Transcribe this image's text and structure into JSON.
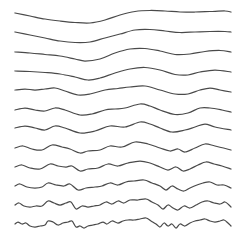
{
  "figure": {
    "width": 252,
    "height": 244,
    "background": "#ffffff",
    "stroke_color": "#4a4a4a",
    "stroke_width": 1.25,
    "lines": [
      {
        "id": 0,
        "baseline": 13,
        "points": [
          [
            15,
            13
          ],
          [
            30,
            16
          ],
          [
            45,
            19
          ],
          [
            60,
            21
          ],
          [
            75,
            22.5
          ],
          [
            90,
            23
          ],
          [
            105,
            20
          ],
          [
            120,
            15
          ],
          [
            135,
            11.5
          ],
          [
            150,
            10.5
          ],
          [
            165,
            11
          ],
          [
            180,
            12
          ],
          [
            195,
            12
          ],
          [
            210,
            11.5
          ],
          [
            225,
            11
          ],
          [
            231,
            12
          ]
        ]
      },
      {
        "id": 1,
        "baseline": 32,
        "points": [
          [
            15,
            32
          ],
          [
            30,
            35
          ],
          [
            45,
            38
          ],
          [
            60,
            41
          ],
          [
            75,
            42.5
          ],
          [
            90,
            42
          ],
          [
            105,
            38
          ],
          [
            120,
            34
          ],
          [
            135,
            30
          ],
          [
            150,
            29.5
          ],
          [
            165,
            31
          ],
          [
            180,
            32.5
          ],
          [
            195,
            32
          ],
          [
            210,
            31.5
          ],
          [
            225,
            31.5
          ],
          [
            231,
            32
          ]
        ]
      },
      {
        "id": 2,
        "baseline": 52,
        "points": [
          [
            15,
            52
          ],
          [
            30,
            53
          ],
          [
            45,
            54.5
          ],
          [
            60,
            56
          ],
          [
            75,
            59
          ],
          [
            85,
            61
          ],
          [
            100,
            59
          ],
          [
            115,
            53
          ],
          [
            130,
            49
          ],
          [
            145,
            48.5
          ],
          [
            160,
            51
          ],
          [
            175,
            54.5
          ],
          [
            190,
            54
          ],
          [
            205,
            51.5
          ],
          [
            220,
            50.5
          ],
          [
            231,
            52
          ]
        ]
      },
      {
        "id": 3,
        "baseline": 71,
        "points": [
          [
            15,
            71
          ],
          [
            30,
            71.5
          ],
          [
            45,
            72.5
          ],
          [
            60,
            74
          ],
          [
            75,
            77
          ],
          [
            88,
            80
          ],
          [
            100,
            78
          ],
          [
            115,
            73
          ],
          [
            130,
            69
          ],
          [
            145,
            67.5
          ],
          [
            160,
            70
          ],
          [
            175,
            74.5
          ],
          [
            188,
            75
          ],
          [
            200,
            72
          ],
          [
            215,
            70
          ],
          [
            231,
            72
          ]
        ]
      },
      {
        "id": 4,
        "baseline": 90,
        "points": [
          [
            15,
            90
          ],
          [
            25,
            89
          ],
          [
            35,
            90
          ],
          [
            45,
            89
          ],
          [
            55,
            88
          ],
          [
            65,
            91
          ],
          [
            78,
            95
          ],
          [
            90,
            94
          ],
          [
            105,
            90
          ],
          [
            118,
            88.5
          ],
          [
            130,
            87
          ],
          [
            145,
            86
          ],
          [
            160,
            90
          ],
          [
            175,
            94
          ],
          [
            188,
            94
          ],
          [
            200,
            90
          ],
          [
            210,
            88
          ],
          [
            220,
            90
          ],
          [
            231,
            92
          ]
        ]
      },
      {
        "id": 5,
        "baseline": 109,
        "points": [
          [
            15,
            110
          ],
          [
            25,
            108
          ],
          [
            35,
            110
          ],
          [
            45,
            111
          ],
          [
            55,
            108
          ],
          [
            65,
            110
          ],
          [
            80,
            115
          ],
          [
            92,
            114
          ],
          [
            105,
            110
          ],
          [
            115,
            109
          ],
          [
            125,
            108
          ],
          [
            140,
            104
          ],
          [
            150,
            106
          ],
          [
            160,
            110
          ],
          [
            175,
            114.5
          ],
          [
            188,
            113
          ],
          [
            200,
            108
          ],
          [
            210,
            108
          ],
          [
            222,
            110
          ],
          [
            231,
            112
          ]
        ]
      },
      {
        "id": 6,
        "baseline": 128,
        "points": [
          [
            15,
            128
          ],
          [
            25,
            126
          ],
          [
            35,
            128
          ],
          [
            45,
            130
          ],
          [
            55,
            126
          ],
          [
            65,
            128
          ],
          [
            80,
            133
          ],
          [
            95,
            131
          ],
          [
            110,
            126
          ],
          [
            125,
            127
          ],
          [
            140,
            122
          ],
          [
            150,
            124
          ],
          [
            160,
            128
          ],
          [
            172,
            132
          ],
          [
            185,
            130
          ],
          [
            195,
            127
          ],
          [
            205,
            124
          ],
          [
            215,
            127
          ],
          [
            231,
            130
          ]
        ]
      },
      {
        "id": 7,
        "baseline": 147,
        "points": [
          [
            15,
            148
          ],
          [
            23,
            146
          ],
          [
            32,
            149
          ],
          [
            42,
            150
          ],
          [
            52,
            145
          ],
          [
            62,
            147
          ],
          [
            70,
            149
          ],
          [
            80,
            153
          ],
          [
            88,
            151
          ],
          [
            100,
            150
          ],
          [
            110,
            146
          ],
          [
            122,
            147
          ],
          [
            135,
            142
          ],
          [
            148,
            144
          ],
          [
            160,
            148
          ],
          [
            170,
            151
          ],
          [
            178,
            149
          ],
          [
            185,
            152
          ],
          [
            195,
            148
          ],
          [
            205,
            144
          ],
          [
            215,
            146
          ],
          [
            231,
            150
          ]
        ]
      },
      {
        "id": 8,
        "baseline": 166,
        "points": [
          [
            15,
            167
          ],
          [
            22,
            165
          ],
          [
            30,
            168
          ],
          [
            40,
            169
          ],
          [
            50,
            164
          ],
          [
            58,
            166
          ],
          [
            66,
            167
          ],
          [
            72,
            166
          ],
          [
            80,
            171
          ],
          [
            88,
            169
          ],
          [
            98,
            168
          ],
          [
            108,
            164
          ],
          [
            118,
            166
          ],
          [
            128,
            163
          ],
          [
            140,
            161
          ],
          [
            150,
            163
          ],
          [
            160,
            167
          ],
          [
            168,
            170
          ],
          [
            176,
            167
          ],
          [
            183,
            171
          ],
          [
            190,
            169
          ],
          [
            198,
            165
          ],
          [
            206,
            162
          ],
          [
            214,
            164
          ],
          [
            222,
            166
          ],
          [
            231,
            169
          ]
        ]
      },
      {
        "id": 9,
        "baseline": 185,
        "points": [
          [
            15,
            186
          ],
          [
            20,
            184
          ],
          [
            27,
            187
          ],
          [
            35,
            188
          ],
          [
            42,
            187
          ],
          [
            48,
            183
          ],
          [
            56,
            185
          ],
          [
            64,
            186
          ],
          [
            70,
            184
          ],
          [
            78,
            190
          ],
          [
            86,
            188
          ],
          [
            95,
            187
          ],
          [
            102,
            186
          ],
          [
            110,
            183
          ],
          [
            118,
            185
          ],
          [
            126,
            182
          ],
          [
            134,
            181
          ],
          [
            144,
            180
          ],
          [
            152,
            183
          ],
          [
            160,
            186
          ],
          [
            166,
            190
          ],
          [
            172,
            186
          ],
          [
            178,
            189
          ],
          [
            184,
            191
          ],
          [
            190,
            188
          ],
          [
            197,
            185
          ],
          [
            203,
            183
          ],
          [
            210,
            182
          ],
          [
            217,
            185
          ],
          [
            224,
            185
          ],
          [
            231,
            188
          ]
        ]
      },
      {
        "id": 10,
        "baseline": 204,
        "points": [
          [
            15,
            205
          ],
          [
            19,
            203
          ],
          [
            24,
            206
          ],
          [
            30,
            207
          ],
          [
            36,
            206
          ],
          [
            42,
            206
          ],
          [
            48,
            201
          ],
          [
            54,
            203
          ],
          [
            60,
            205
          ],
          [
            66,
            203
          ],
          [
            71,
            202
          ],
          [
            76,
            209
          ],
          [
            82,
            206
          ],
          [
            88,
            207
          ],
          [
            94,
            206
          ],
          [
            100,
            205
          ],
          [
            106,
            202
          ],
          [
            112,
            204
          ],
          [
            118,
            201
          ],
          [
            124,
            203
          ],
          [
            130,
            200
          ],
          [
            138,
            200
          ],
          [
            146,
            199
          ],
          [
            152,
            202
          ],
          [
            158,
            205
          ],
          [
            163,
            209
          ],
          [
            168,
            205
          ],
          [
            173,
            208
          ],
          [
            178,
            210
          ],
          [
            184,
            206
          ],
          [
            190,
            208
          ],
          [
            196,
            205
          ],
          [
            202,
            202
          ],
          [
            208,
            201
          ],
          [
            214,
            203
          ],
          [
            220,
            204
          ],
          [
            225,
            202
          ],
          [
            229,
            205
          ],
          [
            231,
            207
          ]
        ]
      },
      {
        "id": 11,
        "baseline": 223,
        "points": [
          [
            15,
            224
          ],
          [
            18,
            222
          ],
          [
            22,
            224
          ],
          [
            26,
            223
          ],
          [
            30,
            226
          ],
          [
            35,
            227
          ],
          [
            40,
            226
          ],
          [
            45,
            225
          ],
          [
            48,
            221
          ],
          [
            53,
            222
          ],
          [
            58,
            225
          ],
          [
            63,
            223
          ],
          [
            68,
            222
          ],
          [
            72,
            221
          ],
          [
            76,
            227
          ],
          [
            80,
            226
          ],
          [
            84,
            228
          ],
          [
            88,
            226
          ],
          [
            93,
            225
          ],
          [
            98,
            224
          ],
          [
            103,
            222
          ],
          [
            107,
            224
          ],
          [
            112,
            221
          ],
          [
            118,
            223
          ],
          [
            123,
            221
          ],
          [
            128,
            220
          ],
          [
            134,
            220
          ],
          [
            140,
            219
          ],
          [
            146,
            218
          ],
          [
            151,
            221
          ],
          [
            156,
            224
          ],
          [
            160,
            227
          ],
          [
            164,
            223
          ],
          [
            168,
            226
          ],
          [
            172,
            224
          ],
          [
            176,
            228
          ],
          [
            180,
            224
          ],
          [
            185,
            226
          ],
          [
            190,
            223
          ],
          [
            195,
            221
          ],
          [
            200,
            220
          ],
          [
            205,
            219
          ],
          [
            210,
            221
          ],
          [
            215,
            222
          ],
          [
            220,
            221
          ],
          [
            224,
            220
          ],
          [
            228,
            223
          ],
          [
            231,
            226
          ]
        ]
      }
    ]
  }
}
